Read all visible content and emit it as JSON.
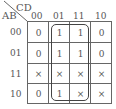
{
  "kmap": {
    "row_var": "AB",
    "col_var": "CD",
    "col_labels": [
      "00",
      "01",
      "11",
      "10"
    ],
    "row_labels": [
      "00",
      "01",
      "11",
      "10"
    ],
    "cells": [
      [
        "0",
        "1",
        "1",
        "0"
      ],
      [
        "0",
        "1",
        "1",
        "0"
      ],
      [
        "×",
        "×",
        "×",
        "×"
      ],
      [
        "0",
        "1",
        "×",
        "×"
      ]
    ],
    "groups": [
      {
        "rows": [
          0,
          3
        ],
        "cols": [
          1,
          2
        ],
        "description": "columns 01 and 11, all rows"
      }
    ]
  }
}
